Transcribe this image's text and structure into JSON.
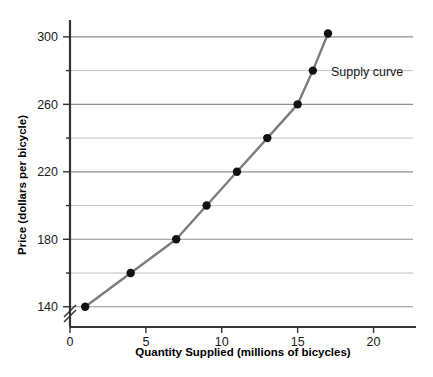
{
  "chart_data": {
    "type": "line",
    "title": "",
    "xlabel": "Quantity Supplied (millions of bicycles)",
    "ylabel": "Price (dollars per bicycle)",
    "series_label": "Supply curve",
    "xlim": [
      0,
      22.6
    ],
    "ylim": [
      128,
      310
    ],
    "xticks": [
      0,
      5,
      10,
      15,
      20
    ],
    "xtick_labels": [
      "0",
      "5",
      "10",
      "15",
      "20"
    ],
    "yticks": [
      140,
      160,
      180,
      200,
      220,
      240,
      260,
      280,
      300
    ],
    "ytick_labels": [
      "140",
      "",
      "180",
      "",
      "220",
      "",
      "260",
      "",
      "300"
    ],
    "ytick_labels_major": [
      "140",
      "180",
      "220",
      "260",
      "300"
    ],
    "grid": true,
    "grid_axis": "y",
    "legend": "none",
    "axis_break": "y",
    "x": [
      1,
      4,
      7,
      9,
      11,
      13,
      15,
      16,
      17
    ],
    "values": [
      140,
      160,
      180,
      200,
      220,
      240,
      260,
      280,
      302
    ],
    "points": [
      {
        "x": 1,
        "y": 140
      },
      {
        "x": 4,
        "y": 160
      },
      {
        "x": 7,
        "y": 180
      },
      {
        "x": 9,
        "y": 200
      },
      {
        "x": 11,
        "y": 220
      },
      {
        "x": 13,
        "y": 240
      },
      {
        "x": 15,
        "y": 260
      },
      {
        "x": 16,
        "y": 280
      },
      {
        "x": 17,
        "y": 302
      }
    ],
    "colors": {
      "line": "#7d7d7d",
      "marker": "#111111",
      "grid": "#8a8a8a",
      "axis": "#333333",
      "background": "#ffffff"
    }
  }
}
